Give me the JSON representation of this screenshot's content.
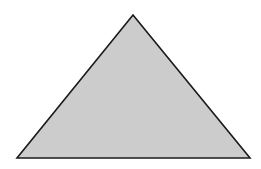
{
  "diagram": {
    "shape": "triangle",
    "vertices": {
      "apex": [
        133,
        15
      ],
      "bottom_left": [
        17,
        158
      ],
      "bottom_right": [
        250,
        158
      ]
    },
    "colors": {
      "fill": "#cccccc",
      "stroke": "#1a1a1a",
      "background": "#ffffff"
    },
    "stroke_width": 1.6
  }
}
